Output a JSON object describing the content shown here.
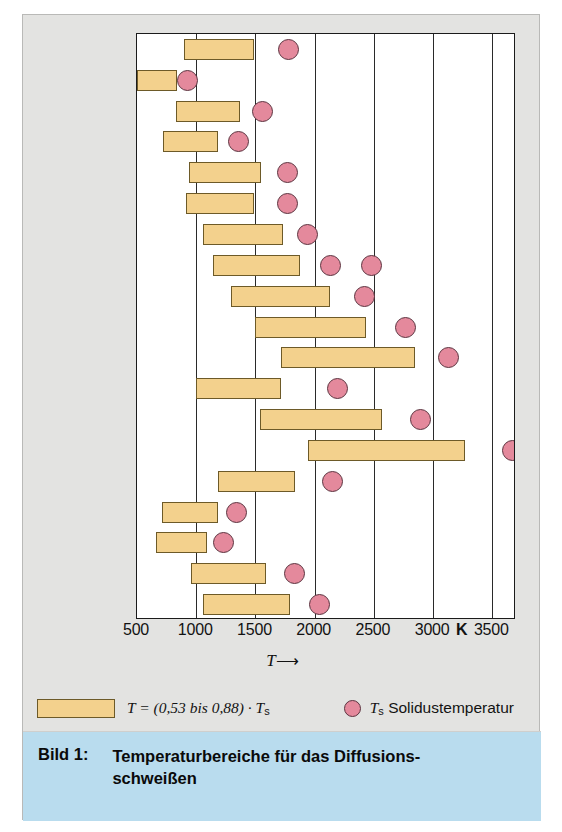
{
  "figure": {
    "caption_number": "Bild 1:",
    "caption_title": "Temperaturbereiche für das Diffusions-\nschweißen"
  },
  "axis": {
    "title_symbol": "T",
    "title_arrow": "⟶",
    "unit": "K",
    "tick_labels": [
      "500",
      "1000",
      "1500",
      "2000",
      "2500",
      "3000",
      "3500"
    ],
    "ticks": [
      500,
      1000,
      1500,
      2000,
      2500,
      3000,
      3500
    ],
    "xmin": 500,
    "xmax": 3700
  },
  "legend": {
    "bar_label_prefix": "T",
    "bar_label": "T = (0,53 bis 0,88) · T",
    "bar_label_sub": "s",
    "dot_label_symbol": "T",
    "dot_label_sub": "s",
    "dot_label": "Solidustemperatur"
  },
  "colors": {
    "bar_fill": "#f3d18d",
    "bar_stroke": "#6d5a28",
    "dot_fill": "#e4899c",
    "dot_stroke": "#5c3440",
    "panel_bg": "#e3e3e1",
    "plot_bg": "#ffffff",
    "caption_bg": "#b9dcee",
    "grid": "#2a2a2a"
  },
  "chart_data": {
    "type": "bar",
    "orientation": "horizontal",
    "xlabel": "T",
    "ylabel": "",
    "xunit": "K",
    "xlim": [
      500,
      3700
    ],
    "ticks": [
      500,
      1000,
      1500,
      2000,
      2500,
      3000,
      3500
    ],
    "grid": "vertical",
    "legend_position": "below-axis",
    "series": [
      {
        "name": "T = (0,53 bis 0,88) · Ts",
        "type": "range-bar"
      },
      {
        "name": "Ts Solidustemperatur",
        "type": "marker"
      }
    ],
    "categories": [
      "Rostfreier\nStahl",
      "Aluminium",
      "Beryllium",
      "Kupfer",
      "Kobalt",
      "Nickel",
      "Titan",
      "Zirkon",
      "Hafnium",
      "Niob",
      "Tantal",
      "Vanadium",
      "Molybdän",
      "Wolfram",
      "Chrom",
      "Gold",
      "Silber",
      "Palladium",
      "Platin"
    ],
    "rows": [
      {
        "label": "Rostfreier\nStahl",
        "range_start": 900,
        "range_end": 1490,
        "solidus": 1780
      },
      {
        "label": "Aluminium",
        "range_start": 500,
        "range_end": 840,
        "solidus": 930
      },
      {
        "label": "Beryllium",
        "range_start": 830,
        "range_end": 1370,
        "solidus": 1560
      },
      {
        "label": "Kupfer",
        "range_start": 720,
        "range_end": 1180,
        "solidus": 1360
      },
      {
        "label": "Kobalt",
        "range_start": 940,
        "range_end": 1550,
        "solidus": 1770
      },
      {
        "label": "Nickel",
        "range_start": 910,
        "range_end": 1490,
        "solidus": 1770
      },
      {
        "label": "Titan",
        "range_start": 1060,
        "range_end": 1730,
        "solidus": 1940
      },
      {
        "label": "Zirkon",
        "range_start": 1140,
        "range_end": 1880,
        "solidus": 2130,
        "solidus2": 2480
      },
      {
        "label": "Hafnium",
        "range_start": 1290,
        "range_end": 2130,
        "solidus": 2420
      },
      {
        "label": "Niob",
        "range_start": 1500,
        "range_end": 2430,
        "solidus": 2770
      },
      {
        "label": "Tantal",
        "range_start": 1720,
        "range_end": 2850,
        "solidus": 3130
      },
      {
        "label": "Vanadium",
        "range_start": 1000,
        "range_end": 1720,
        "solidus": 2190
      },
      {
        "label": "Molybdän",
        "range_start": 1540,
        "range_end": 2570,
        "solidus": 2890
      },
      {
        "label": "Wolfram",
        "range_start": 1940,
        "range_end": 3270,
        "solidus": 3670
      },
      {
        "label": "Chrom",
        "range_start": 1180,
        "range_end": 1830,
        "solidus": 2150
      },
      {
        "label": "Gold",
        "range_start": 710,
        "range_end": 1180,
        "solidus": 1340
      },
      {
        "label": "Silber",
        "range_start": 660,
        "range_end": 1090,
        "solidus": 1230
      },
      {
        "label": "Palladium",
        "range_start": 960,
        "range_end": 1590,
        "solidus": 1830
      },
      {
        "label": "Platin",
        "range_start": 1060,
        "range_end": 1790,
        "solidus": 2040
      }
    ]
  }
}
